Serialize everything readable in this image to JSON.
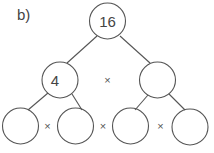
{
  "label": "b)",
  "colors": {
    "stroke": "#555555",
    "text": "#444444",
    "background": "#ffffff"
  },
  "tree": {
    "root": {
      "value": "16"
    },
    "level1": [
      {
        "value": "4"
      },
      {
        "value": ""
      }
    ],
    "level1_operator": "×",
    "level2": [
      {
        "value": ""
      },
      {
        "value": ""
      },
      {
        "value": ""
      },
      {
        "value": ""
      }
    ],
    "level2_operators": [
      "×",
      "×",
      "×"
    ]
  }
}
